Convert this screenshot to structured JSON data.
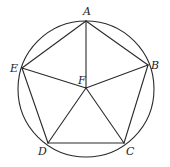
{
  "diagram": {
    "type": "geometry",
    "circle": {
      "cx": 86,
      "cy": 89,
      "r": 68
    },
    "points": {
      "A": {
        "x": 86,
        "y": 21,
        "label": "A",
        "lx": 83,
        "ly": 15
      },
      "B": {
        "x": 148,
        "y": 65,
        "label": "B",
        "lx": 151,
        "ly": 69
      },
      "C": {
        "x": 124,
        "y": 143,
        "label": "C",
        "lx": 126,
        "ly": 155
      },
      "D": {
        "x": 48,
        "y": 143,
        "label": "D",
        "lx": 38,
        "ly": 155
      },
      "E": {
        "x": 22,
        "y": 68,
        "label": "E",
        "lx": 10,
        "ly": 72
      },
      "F": {
        "x": 86,
        "y": 88,
        "label": "F",
        "lx": 78,
        "ly": 84
      }
    },
    "segments": [
      [
        "A",
        "B"
      ],
      [
        "B",
        "C"
      ],
      [
        "C",
        "D"
      ],
      [
        "D",
        "E"
      ],
      [
        "E",
        "A"
      ],
      [
        "F",
        "A"
      ],
      [
        "F",
        "B"
      ],
      [
        "F",
        "C"
      ],
      [
        "F",
        "D"
      ],
      [
        "F",
        "E"
      ]
    ]
  }
}
